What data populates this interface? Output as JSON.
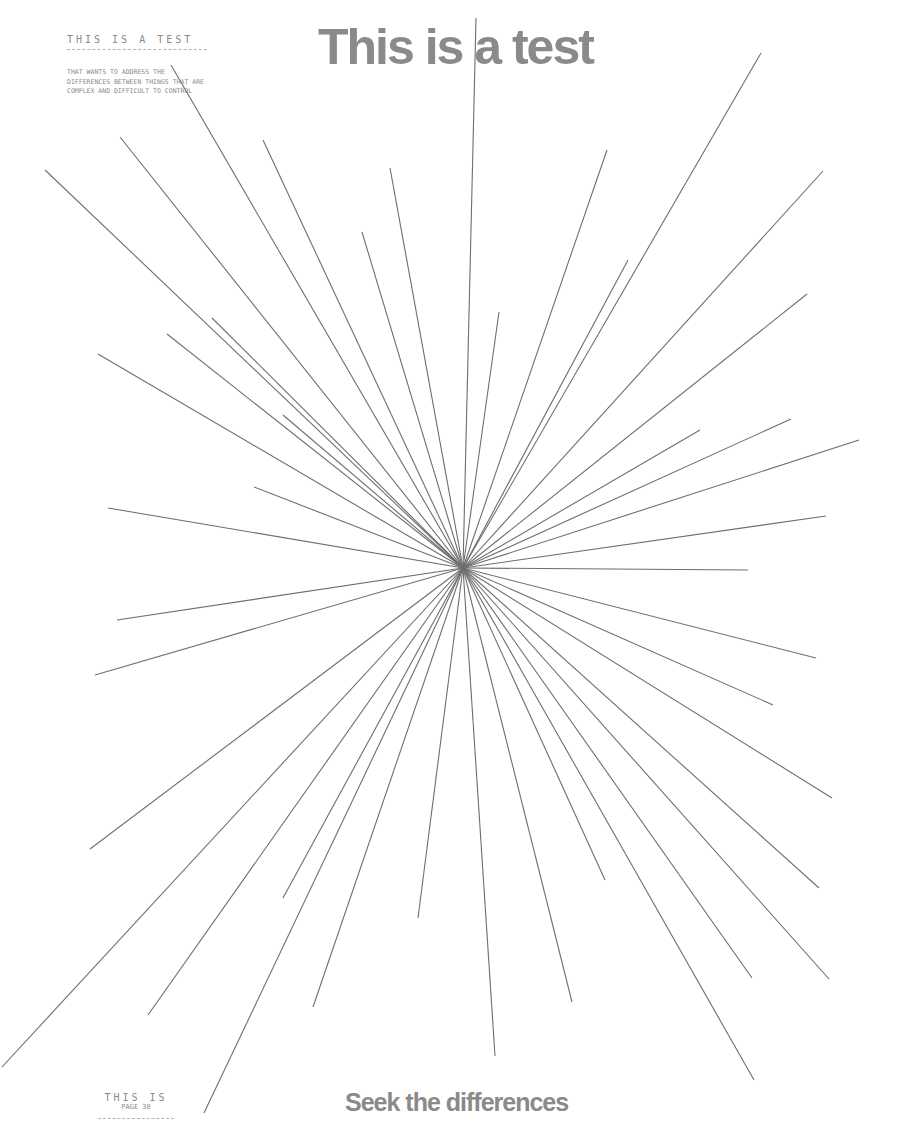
{
  "header": {
    "kicker": "THIS IS A TEST",
    "blurb": "THAT WANTS TO ADDRESS THE DIFFERENCES BETWEEN THINGS THAT ARE COMPLEX AND DIFFICULT TO CONTROL"
  },
  "title": "This is a test",
  "footer": {
    "kicker": "THIS IS",
    "page_label": "PAGE 38",
    "tagline": "Seek the differences"
  },
  "graphic": {
    "type": "radial-burst",
    "stroke_color": "#6e6e6e",
    "center": [
      463,
      568
    ],
    "ray_endpoints": [
      [
        476,
        18
      ],
      [
        499,
        312
      ],
      [
        607,
        150
      ],
      [
        628,
        260
      ],
      [
        761,
        53
      ],
      [
        823,
        171
      ],
      [
        807,
        294
      ],
      [
        700,
        430
      ],
      [
        791,
        419
      ],
      [
        859,
        440
      ],
      [
        826,
        516
      ],
      [
        748,
        570
      ],
      [
        816,
        658
      ],
      [
        773,
        705
      ],
      [
        832,
        798
      ],
      [
        819,
        888
      ],
      [
        829,
        979
      ],
      [
        752,
        978
      ],
      [
        754,
        1080
      ],
      [
        605,
        880
      ],
      [
        572,
        1002
      ],
      [
        495,
        1056
      ],
      [
        418,
        918
      ],
      [
        313,
        1007
      ],
      [
        283,
        898
      ],
      [
        148,
        1015
      ],
      [
        2,
        1067
      ],
      [
        204,
        1113
      ],
      [
        90,
        849
      ],
      [
        95,
        675
      ],
      [
        117,
        620
      ],
      [
        108,
        508
      ],
      [
        254,
        487
      ],
      [
        98,
        354
      ],
      [
        167,
        334
      ],
      [
        212,
        318
      ],
      [
        283,
        415
      ],
      [
        45,
        170
      ],
      [
        120,
        137
      ],
      [
        171,
        65
      ],
      [
        263,
        140
      ],
      [
        362,
        232
      ],
      [
        390,
        168
      ]
    ]
  }
}
